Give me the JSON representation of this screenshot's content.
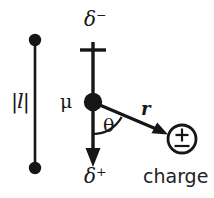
{
  "figure": {
    "type": "diagram",
    "colors": {
      "stroke": "#161616",
      "text": "#161616",
      "background": "#ffffff"
    },
    "bond": {
      "label": "|l|",
      "description": "bond length magnitude between two atom centers",
      "top_atom": {
        "x": 35,
        "y": 40,
        "radius": 6
      },
      "bottom_atom": {
        "x": 35,
        "y": 168,
        "radius": 6
      }
    },
    "dipole": {
      "vector_label": "μ",
      "negative_end_label": "δ⁻",
      "positive_end_label": "δ⁺",
      "origin": {
        "x": 93,
        "y": 102
      },
      "tail": {
        "x": 93,
        "y": 50
      },
      "head": {
        "x": 93,
        "y": 163
      },
      "cross_tick_y": 50,
      "center_dot_radius": 9
    },
    "distance_vector": {
      "label": "r",
      "from": {
        "x": 93,
        "y": 102
      },
      "to": {
        "x": 166,
        "y": 133
      }
    },
    "angle": {
      "label": "θ",
      "between": "dipole positive axis and r vector",
      "arc_radius": 30
    },
    "charge": {
      "symbol": "±",
      "label": "charge",
      "center": {
        "x": 182,
        "y": 139
      },
      "radius": 14
    }
  }
}
